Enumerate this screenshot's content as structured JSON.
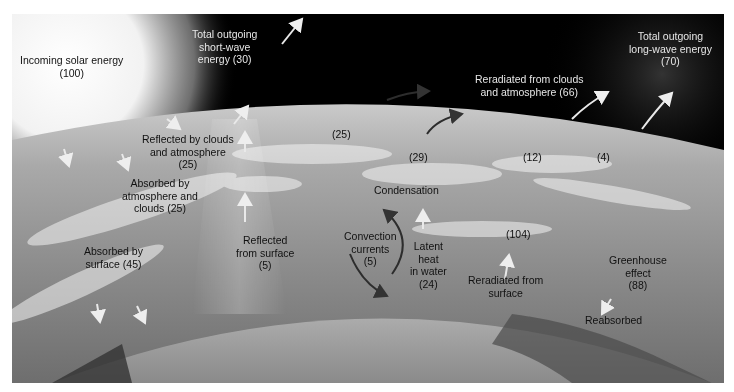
{
  "diagram": {
    "colors": {
      "sky": "#000000",
      "atmosphere": "#b9b9b9",
      "sun": "#ffffff",
      "earth": "#7a7a7a",
      "arrow_light": "#e8e8e8",
      "arrow_dark": "#3a3a3a"
    },
    "labels": {
      "incoming_solar": {
        "line1": "Incoming solar energy",
        "line2": "(100)"
      },
      "outgoing_short": {
        "line1": "Total outgoing",
        "line2": "short-wave",
        "line3": "energy (30)"
      },
      "outgoing_long": {
        "line1": "Total outgoing",
        "line2": "long-wave energy",
        "line3": "(70)"
      },
      "reradiated_clouds": {
        "line1": "Reradiated from clouds",
        "line2": "and atmosphere (66)"
      },
      "reflected_clouds": {
        "line1": "Reflected by clouds",
        "line2": "and atmosphere",
        "line3": "(25)"
      },
      "absorbed_atmos": {
        "line1": "Absorbed by",
        "line2": "atmosphere and",
        "line3": "clouds (25)"
      },
      "absorbed_surface": {
        "line1": "Absorbed by",
        "line2": "surface (45)"
      },
      "reflected_surface": {
        "line1": "Reflected",
        "line2": "from surface",
        "line3": "(5)"
      },
      "value_25": "(25)",
      "value_29": "(29)",
      "value_12": "(12)",
      "value_4": "(4)",
      "condensation": "Condensation",
      "convection": {
        "line1": "Convection",
        "line2": "currents",
        "line3": "(5)"
      },
      "latent_heat": {
        "line1": "Latent",
        "line2": "heat",
        "line3": "in water",
        "line4": "(24)"
      },
      "value_104": "(104)",
      "reradiated_surface": {
        "line1": "Reradiated from",
        "line2": "surface"
      },
      "greenhouse": {
        "line1": "Greenhouse",
        "line2": "effect",
        "line3": "(88)"
      },
      "reabsorbed": "Reabsorbed"
    }
  }
}
